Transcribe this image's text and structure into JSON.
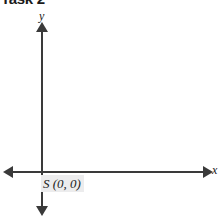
{
  "title": "Task 2",
  "chart_data": {
    "type": "scatter",
    "title": "Task 2",
    "xlabel": "x",
    "ylabel": "y",
    "grid": false,
    "legend": "none",
    "axes": {
      "x_axis": {
        "label": "x",
        "orientation": "horizontal",
        "arrow_start": "left",
        "arrow_end": "right",
        "tick_labels": []
      },
      "y_axis": {
        "label": "y",
        "orientation": "vertical",
        "arrow_start": "down",
        "arrow_end": "up",
        "tick_labels": []
      }
    },
    "points": [
      {
        "label": "S",
        "coordinates": "(0, 0)",
        "display": "S (0, 0)",
        "x": 0,
        "y": 0
      }
    ],
    "annotations": [
      {
        "text": "S (0, 0)",
        "at": "origin"
      }
    ]
  },
  "colors": {
    "axis": "#3a3a3a",
    "text": "#1b1b1b",
    "label_highlight": "#ececed",
    "background": "#ffffff"
  }
}
